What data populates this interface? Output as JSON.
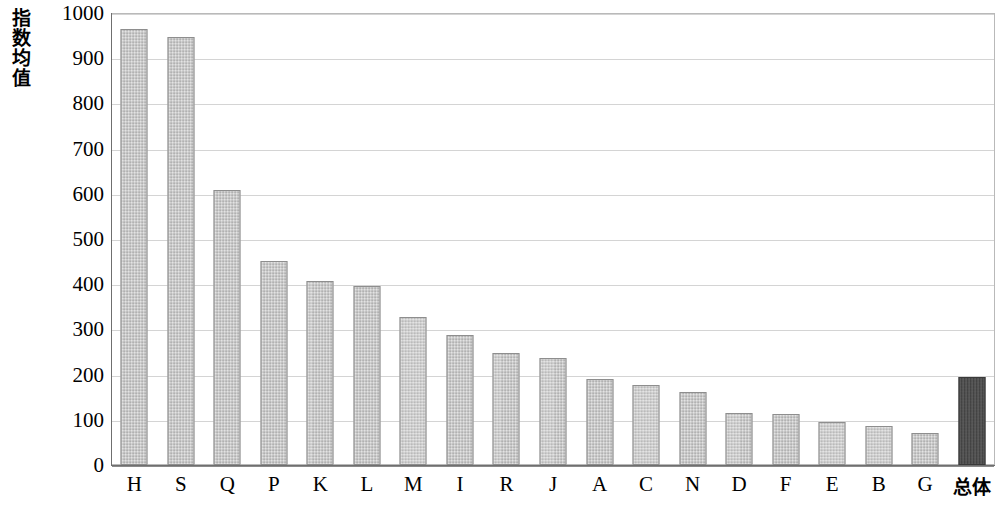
{
  "chart_data": {
    "type": "bar",
    "title": "",
    "xlabel": "",
    "ylabel": "指数均值",
    "ylim": [
      0,
      1000
    ],
    "ytick_labels": [
      "1000",
      "900",
      "800",
      "700",
      "600",
      "500",
      "400",
      "300",
      "200",
      "100",
      "0"
    ],
    "ytick_values": [
      1000,
      900,
      800,
      700,
      600,
      500,
      400,
      300,
      200,
      100,
      0
    ],
    "grid": true,
    "legend": "none",
    "categories": [
      "H",
      "S",
      "Q",
      "P",
      "K",
      "L",
      "M",
      "I",
      "R",
      "J",
      "A",
      "C",
      "N",
      "D",
      "F",
      "E",
      "B",
      "G",
      "总体"
    ],
    "values": [
      965,
      947,
      608,
      452,
      407,
      395,
      328,
      288,
      248,
      236,
      191,
      176,
      161,
      114,
      112,
      96,
      86,
      71,
      195
    ],
    "series": [
      {
        "name": "指数均值",
        "values": [
          965,
          947,
          608,
          452,
          407,
          395,
          328,
          288,
          248,
          236,
          191,
          176,
          161,
          114,
          112,
          96,
          86,
          71,
          195
        ]
      }
    ],
    "highlight_category": "总体",
    "colors": {
      "bar_fill": "#c9c9c9",
      "bar_border": "#8e8e8e",
      "highlight_fill": "#4a4a4a",
      "highlight_border": "#3a3a3a",
      "gridline": "#d4d4d4",
      "axis": "#6f6f6f",
      "text": "#000000",
      "background": "#ffffff"
    }
  }
}
